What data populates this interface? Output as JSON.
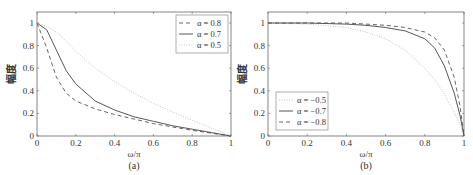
{
  "chart_data": [
    {
      "type": "line",
      "panel_label": "(a)",
      "xlabel": "ω/π",
      "ylabel": "幅度",
      "xlim": [
        0,
        1
      ],
      "ylim": [
        0,
        1.1
      ],
      "x_ticks": [
        "0",
        "0.2",
        "0.4",
        "0.6",
        "0.8",
        "1"
      ],
      "y_ticks": [
        "0",
        "0.2",
        "0.4",
        "0.6",
        "0.8",
        "1"
      ],
      "grid": false,
      "legend_position": "upper right",
      "x": [
        0,
        0.05,
        0.1,
        0.15,
        0.2,
        0.3,
        0.4,
        0.5,
        0.6,
        0.7,
        0.8,
        0.9,
        1.0
      ],
      "series": [
        {
          "name": "α = 0.8",
          "style": "dashed",
          "values": [
            1.0,
            0.78,
            0.52,
            0.38,
            0.31,
            0.24,
            0.19,
            0.15,
            0.11,
            0.08,
            0.05,
            0.025,
            0.0
          ]
        },
        {
          "name": "α = 0.7",
          "style": "solid",
          "values": [
            1.0,
            0.94,
            0.76,
            0.58,
            0.46,
            0.31,
            0.23,
            0.17,
            0.13,
            0.09,
            0.06,
            0.03,
            0.0
          ]
        },
        {
          "name": "α = 0.5",
          "style": "dotted",
          "values": [
            1.0,
            0.97,
            0.92,
            0.84,
            0.75,
            0.6,
            0.48,
            0.38,
            0.29,
            0.21,
            0.14,
            0.07,
            0.0
          ]
        }
      ]
    },
    {
      "type": "line",
      "panel_label": "(b)",
      "xlabel": "ω/π",
      "ylabel": "幅度",
      "xlim": [
        0,
        1
      ],
      "ylim": [
        0,
        1.1
      ],
      "x_ticks": [
        "0",
        "0.2",
        "0.4",
        "0.6",
        "0.8",
        "1"
      ],
      "y_ticks": [
        "0",
        "0.2",
        "0.4",
        "0.6",
        "0.8",
        "1"
      ],
      "grid": false,
      "legend_position": "lower left",
      "x": [
        0,
        0.2,
        0.4,
        0.5,
        0.6,
        0.7,
        0.8,
        0.85,
        0.9,
        0.95,
        0.98,
        1.0
      ],
      "series": [
        {
          "name": "α = −0.5",
          "style": "dotted",
          "values": [
            1.0,
            0.99,
            0.96,
            0.92,
            0.86,
            0.76,
            0.6,
            0.5,
            0.37,
            0.21,
            0.1,
            0.0
          ]
        },
        {
          "name": "α = −0.7",
          "style": "solid",
          "values": [
            1.0,
            1.0,
            0.99,
            0.98,
            0.96,
            0.93,
            0.86,
            0.78,
            0.62,
            0.38,
            0.18,
            0.0
          ]
        },
        {
          "name": "α = −0.8",
          "style": "dashed",
          "values": [
            1.0,
            1.0,
            1.0,
            0.99,
            0.98,
            0.96,
            0.92,
            0.87,
            0.76,
            0.52,
            0.26,
            0.0
          ]
        }
      ]
    }
  ]
}
